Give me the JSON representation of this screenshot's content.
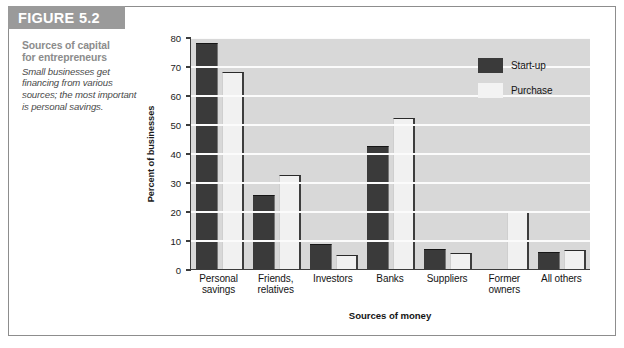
{
  "figure": {
    "banner_label": "FIGURE 5.2",
    "caption_title_line1": "Sources of capital",
    "caption_title_line2": "for entrepreneurs",
    "caption_body": "Small businesses get financing from various sources; the most important is personal savings."
  },
  "colors": {
    "banner_bg": "#9a9a9a",
    "plot_bg": "#d8d8d8",
    "gridline": "#fbfbfb",
    "startup_bar": "#3a3a3a",
    "purchase_bar": "#f1f1f1",
    "axis": "#3c3c3c",
    "caption_title": "#8c8c8c"
  },
  "chart_data": {
    "type": "bar",
    "title": "Sources of capital for entrepreneurs",
    "xlabel": "Sources of money",
    "ylabel": "Percent of businesses",
    "categories": [
      "Personal savings",
      "Friends, relatives",
      "Investors",
      "Banks",
      "Suppliers",
      "Former owners",
      "All others"
    ],
    "category_lines": [
      [
        "Personal",
        "savings"
      ],
      [
        "Friends,",
        "relatives"
      ],
      [
        "Investors",
        ""
      ],
      [
        "Banks",
        ""
      ],
      [
        "Suppliers",
        ""
      ],
      [
        "Former",
        "owners"
      ],
      [
        "All others",
        ""
      ]
    ],
    "series": [
      {
        "name": "Start-up",
        "values": [
          78,
          25.5,
          8.5,
          42.5,
          7,
          0,
          6
        ]
      },
      {
        "name": "Purchase",
        "values": [
          68,
          32.5,
          5,
          52,
          5.5,
          20,
          6.5
        ]
      }
    ],
    "ylim": [
      0,
      80
    ],
    "yticks": [
      0,
      10,
      20,
      30,
      40,
      50,
      60,
      70,
      80
    ],
    "ytick_labels": [
      "0",
      "10",
      "20",
      "30",
      "40",
      "50",
      "60",
      "70",
      "80"
    ],
    "grid": true,
    "legend_position": "top-right",
    "legend": [
      "Start-up",
      "Purchase"
    ]
  }
}
